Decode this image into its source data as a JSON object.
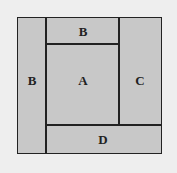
{
  "diagram": {
    "regions": [
      {
        "id": "left",
        "label": "B"
      },
      {
        "id": "top",
        "label": "B"
      },
      {
        "id": "center",
        "label": "A"
      },
      {
        "id": "right",
        "label": "C"
      },
      {
        "id": "bottom",
        "label": "D"
      }
    ],
    "colors": {
      "fill": "#c8c8c8",
      "border": "#222222",
      "background": "#eeeeee"
    }
  }
}
